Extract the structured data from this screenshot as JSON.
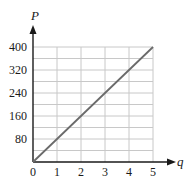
{
  "chart_data": {
    "type": "line",
    "title": "",
    "xlabel": "q",
    "ylabel": "P",
    "xlim": [
      0,
      5
    ],
    "ylim": [
      0,
      400
    ],
    "x_ticks": [
      0,
      1,
      2,
      3,
      4,
      5
    ],
    "y_ticks": [
      80,
      160,
      240,
      320,
      400
    ],
    "x_tick_labels": [
      "0",
      "1",
      "2",
      "3",
      "4",
      "5"
    ],
    "y_tick_labels": [
      "80",
      "160",
      "240",
      "320",
      "400"
    ],
    "grid": true,
    "grid_minor_y_step": 40,
    "grid_x_step": 1,
    "legend": null,
    "series": [
      {
        "name": "P = 80q",
        "x": [
          0,
          1,
          2,
          3,
          4,
          5
        ],
        "y": [
          0,
          80,
          160,
          240,
          320,
          400
        ]
      }
    ],
    "colors": {
      "line": "#6b6b6b",
      "axis": "#1a1a1a",
      "grid": "#c8c8c8"
    }
  }
}
